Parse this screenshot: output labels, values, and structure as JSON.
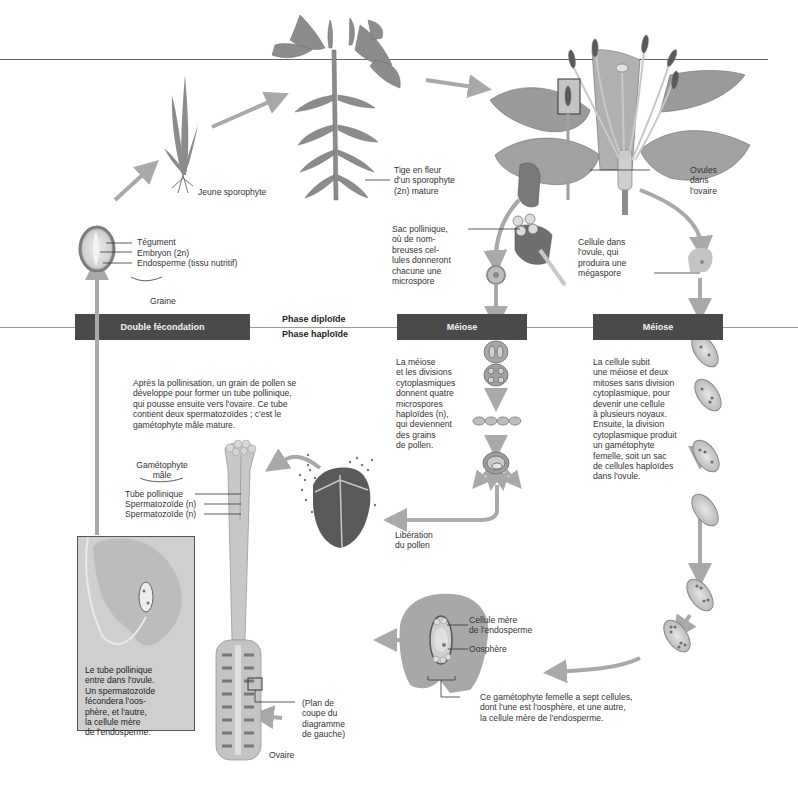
{
  "phases": {
    "diploid": "Phase diploïde",
    "haploid": "Phase haploïde"
  },
  "bars": {
    "double_fertilization": "Double fécondation",
    "meiosis_male": "Méiose",
    "meiosis_female": "Méiose"
  },
  "labels": {
    "young_sporophyte": "Jeune sporophyte",
    "mature_sporophyte": [
      "Tige en fleur",
      "d'un sporophyte",
      "(2n) mature"
    ],
    "ovules_in_ovary": [
      "Ovules",
      "dans",
      "l'ovaire"
    ],
    "seed_parts": [
      "Tégument",
      "Embryon (2n)",
      "Endosperme (tissu nutritif)"
    ],
    "seed": "Graine",
    "pollen_sac": [
      "Sac pollinique,",
      "où de nom-",
      "breuses cel-",
      "lules donneront",
      "chacune une",
      "microspore"
    ],
    "ovule_cell": [
      "Cellule dans",
      "l'ovule, qui",
      "produira une",
      "mégaspore"
    ],
    "male_meiosis_text": [
      "La méiose",
      "et les divisions",
      "cytoplasmiques",
      "donnent quatre",
      "microspores",
      "haploïdes (n),",
      "qui deviennent",
      "des grains",
      "de pollen."
    ],
    "female_meiosis_text": [
      "La cellule subit",
      "une méiose et deux",
      "mitoses sans division",
      "cytoplasmique, pour",
      "devenir une cellule",
      "à plusieurs noyaux.",
      "Ensuite, la division",
      "cytoplasmique produit",
      "un gamétophyte",
      "femelle, soit un sac",
      "de cellules haploïdes",
      "dans l'ovule."
    ],
    "pollination_text": [
      "Après la pollinisation, un grain de pollen se",
      "développe pour former un tube pollinique,",
      "qui pousse ensuite vers l'ovaire. Ce tube",
      "contient deux spermatozoïdes ; c'est le",
      "gamétophyte mâle mature."
    ],
    "male_gametophyte": [
      "Gamétophyte",
      "mâle"
    ],
    "male_gametophyte_parts": [
      "Tube pollinique",
      "Spermatozoïde (n)",
      "Spermatozoïde (n)"
    ],
    "pollen_release": [
      "Libération",
      "du pollen"
    ],
    "inset_text": [
      "Le tube pollinique",
      "entre dans l'ovule.",
      "Un spermatozoïde",
      "fécondera l'oos-",
      "phère, et l'autre,",
      "la cellule mère",
      "de l'endosperme."
    ],
    "section_plane": [
      "(Plan de",
      "coupe du",
      "diagramme",
      "de gauche)"
    ],
    "ovary": "Ovaire",
    "endosperm_mother_cell": [
      "Cellule mère",
      "de l'endosperme"
    ],
    "egg_cell": "Oosphère",
    "female_gametophyte_text": [
      "Ce gamétophyte femelle a sept cellules,",
      "dont l'une est l'oosphère, et une autre,",
      "la cellule mère de l'endosperme."
    ]
  },
  "colors": {
    "bar": "#4a4a4a",
    "arrow": "#a9a9a9",
    "plant": "#8c8c8c",
    "plant_dark": "#6b6b6b",
    "inset_bg": "#cfcfcf"
  }
}
